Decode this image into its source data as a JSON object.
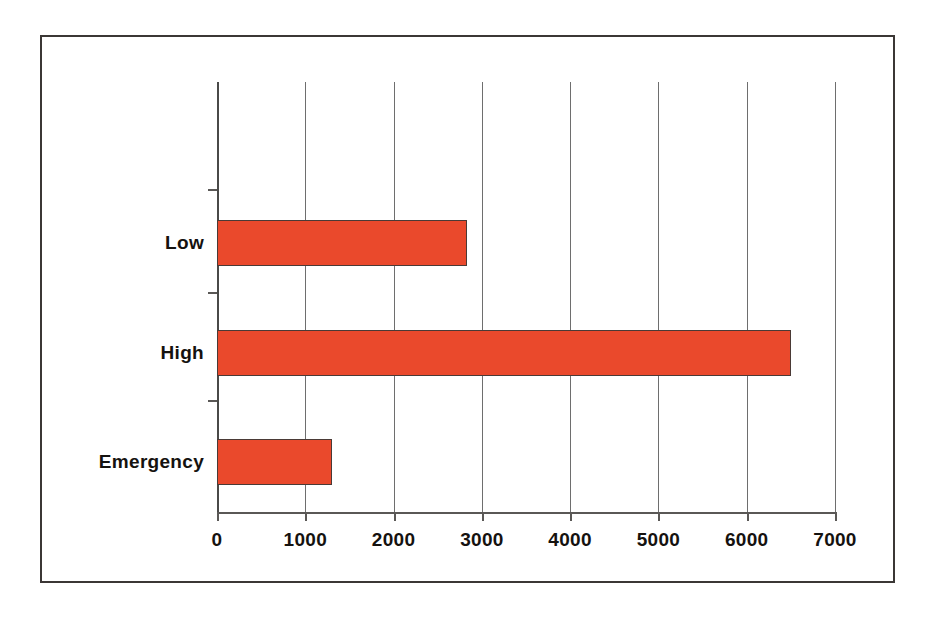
{
  "chart_data": {
    "type": "bar",
    "orientation": "horizontal",
    "title": "",
    "subtitle": "",
    "xlabel": "",
    "ylabel": "",
    "categories": [
      "Emergency",
      "High",
      "Low"
    ],
    "values": [
      1300,
      6500,
      2830
    ],
    "series": [
      {
        "name": "",
        "values": [
          1300,
          6500,
          2830
        ],
        "color": "#ea492c"
      }
    ],
    "xlim": [
      0,
      7000
    ],
    "xticks": [
      0,
      1000,
      2000,
      3000,
      4000,
      5000,
      6000,
      7000
    ],
    "xticklabels": [
      "0",
      "1000",
      "2000",
      "3000",
      "4000",
      "5000",
      "6000",
      "7000"
    ],
    "yticklabels": [
      "Emergency",
      "High",
      "Low"
    ],
    "grid": "vertical-major-only",
    "legend": "none",
    "colors": {
      "bar_fill": "#ea492c",
      "bar_edge": "#4a3a36",
      "gridline": "#6e6e6e",
      "axis": "#5a5856",
      "frame": "#3b3735",
      "text": "#15120f",
      "background": "#ffffff"
    }
  },
  "axis": {
    "ticks": [
      {
        "label": "0",
        "value": 0
      },
      {
        "label": "1000",
        "value": 1000
      },
      {
        "label": "2000",
        "value": 2000
      },
      {
        "label": "3000",
        "value": 3000
      },
      {
        "label": "4000",
        "value": 4000
      },
      {
        "label": "5000",
        "value": 5000
      },
      {
        "label": "6000",
        "value": 6000
      },
      {
        "label": "7000",
        "value": 7000
      }
    ]
  },
  "bars": [
    {
      "label": "Low",
      "value": 2830
    },
    {
      "label": "High",
      "value": 6500
    },
    {
      "label": "Emergency",
      "value": 1300
    }
  ]
}
